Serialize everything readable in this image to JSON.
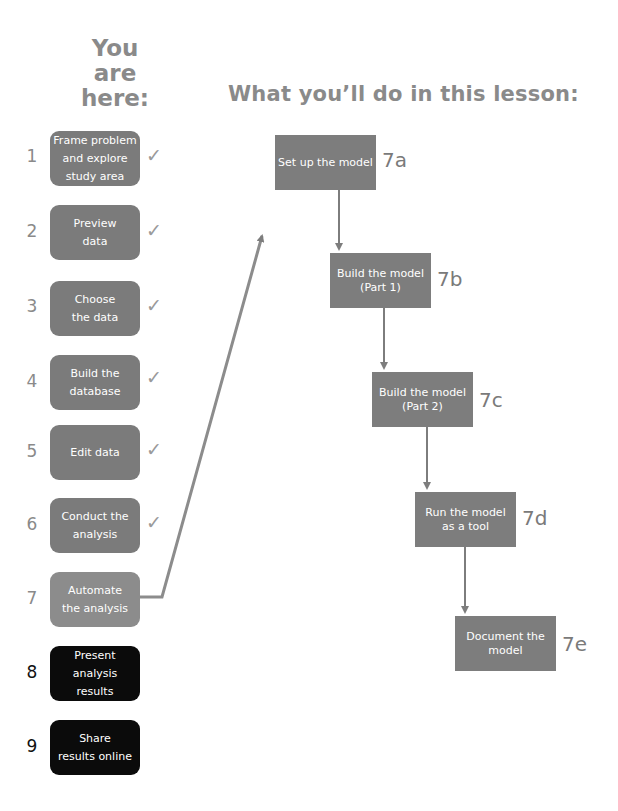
{
  "header": {
    "you_are_here": "You\nare\nhere:",
    "lesson_title": "What you’ll do in this lesson:"
  },
  "steps": [
    {
      "number": "1",
      "label": "Frame problem\nand explore\nstudy area",
      "status": "done",
      "check": "✓"
    },
    {
      "number": "2",
      "label": "Preview\ndata",
      "status": "done",
      "check": "✓"
    },
    {
      "number": "3",
      "label": "Choose\nthe data",
      "status": "done",
      "check": "✓"
    },
    {
      "number": "4",
      "label": "Build the\ndatabase",
      "status": "done",
      "check": "✓"
    },
    {
      "number": "5",
      "label": "Edit data",
      "status": "done",
      "check": "✓"
    },
    {
      "number": "6",
      "label": "Conduct the\nanalysis",
      "status": "done",
      "check": "✓"
    },
    {
      "number": "7",
      "label": "Automate\nthe analysis",
      "status": "current"
    },
    {
      "number": "8",
      "label": "Present\nanalysis\nresults",
      "status": "future"
    },
    {
      "number": "9",
      "label": "Share\nresults online",
      "status": "future"
    }
  ],
  "substeps": [
    {
      "id": "7a",
      "label": "Set up the model"
    },
    {
      "id": "7b",
      "label": "Build the model\n(Part 1)"
    },
    {
      "id": "7c",
      "label": "Build the model\n(Part 2)"
    },
    {
      "id": "7d",
      "label": "Run the model\nas a tool"
    },
    {
      "id": "7e",
      "label": "Document the\nmodel"
    }
  ],
  "colors": {
    "done": "#7b7b7b",
    "current": "#8c8c8c",
    "future": "#0b0b0b",
    "substep": "#7d7d7d",
    "arrow": "#7d7d7d",
    "heading": "#8a8a8a"
  }
}
